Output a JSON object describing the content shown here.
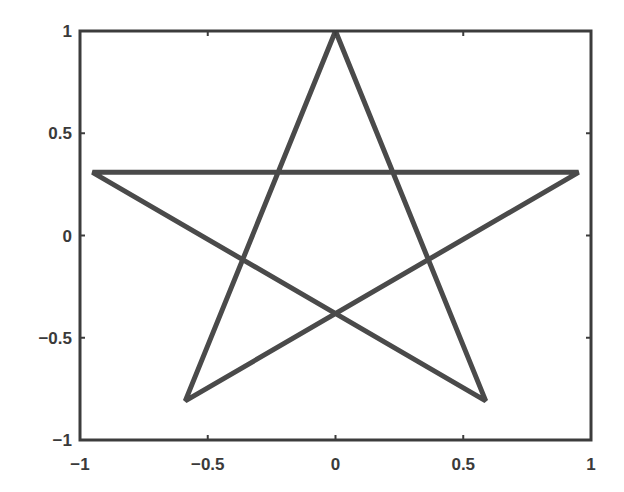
{
  "chart_data": {
    "type": "line",
    "title": "",
    "xlabel": "",
    "ylabel": "",
    "xlim": [
      -1,
      1
    ],
    "ylim": [
      -1,
      1
    ],
    "grid": false,
    "legend": null,
    "x_ticks": [
      -1,
      -0.5,
      0,
      0.5,
      1
    ],
    "y_ticks": [
      -1,
      -0.5,
      0,
      0.5,
      1
    ],
    "x_tick_labels": [
      "−1",
      "−0.5",
      "0",
      "0.5",
      "1"
    ],
    "y_tick_labels": [
      "−1",
      "−0.5",
      "0",
      "0.5",
      "1"
    ],
    "series": [
      {
        "name": "pentagram",
        "color": "#4a4a4a",
        "line_width": 5,
        "x": [
          0,
          0.588,
          -0.951,
          0.951,
          -0.588,
          0
        ],
        "y": [
          1,
          -0.809,
          0.309,
          0.309,
          -0.809,
          1
        ]
      }
    ]
  },
  "style": {
    "axes_color": "#3c3c3c",
    "line_color": "#4a4a4a",
    "background": "#ffffff"
  }
}
